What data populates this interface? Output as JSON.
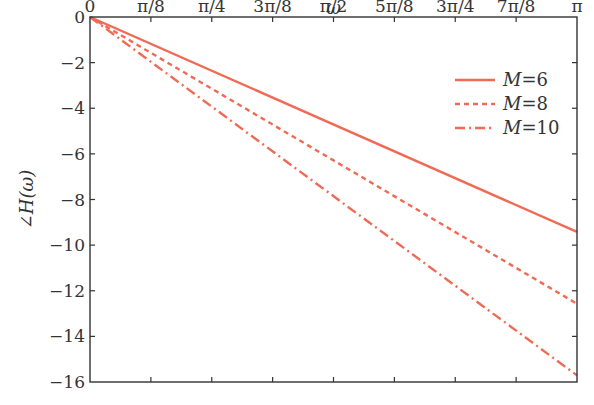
{
  "chart_data": {
    "type": "line",
    "title": "",
    "xlabel": "ω",
    "ylabel": "∠H(ω)",
    "xlim": [
      0,
      3.14159
    ],
    "ylim": [
      -16,
      0
    ],
    "grid": false,
    "legend_position": "upper right",
    "x_ticks": [
      0,
      0.3927,
      0.7854,
      1.1781,
      1.5708,
      1.9635,
      2.3562,
      2.7489,
      3.14159
    ],
    "x_tick_labels": [
      "0",
      "π/8",
      "π/4",
      "3π/8",
      "π/2",
      "5π/8",
      "3π/4",
      "7π/8",
      "π"
    ],
    "y_ticks": [
      0,
      -2,
      -4,
      -6,
      -8,
      -10,
      -12,
      -14,
      -16
    ],
    "y_tick_labels": [
      "0",
      "−2",
      "−4",
      "−6",
      "−8",
      "−10",
      "−12",
      "−14",
      "−16"
    ],
    "x": [
      0,
      3.14159
    ],
    "series": [
      {
        "name": "M=6",
        "label_var": "M",
        "label_val": "6",
        "style": "solid",
        "values": [
          0,
          -9.42
        ]
      },
      {
        "name": "M=8",
        "label_var": "M",
        "label_val": "8",
        "style": "dotted",
        "values": [
          0,
          -12.57
        ]
      },
      {
        "name": "M=10",
        "label_var": "M",
        "label_val": "10",
        "style": "dashdot",
        "values": [
          0,
          -15.71
        ]
      }
    ],
    "line_color": "#f06a55"
  }
}
